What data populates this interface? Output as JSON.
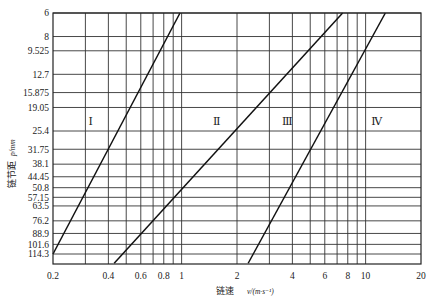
{
  "chart_data": {
    "type": "line",
    "title": "",
    "xlabel": "链速",
    "xlabel_unit": "v/(m·s⁻¹)",
    "ylabel": "链节距",
    "ylabel_unit": "p/mm",
    "x_scale": "log",
    "y_scale": "log",
    "y_inverted": true,
    "xlim": [
      0.2,
      20
    ],
    "ylim": [
      6,
      114.3
    ],
    "grid": true,
    "x_ticks": [
      0.2,
      0.4,
      0.6,
      0.8,
      1,
      2,
      4,
      6,
      8,
      10,
      20
    ],
    "x_tick_labels": [
      "0.2",
      "0.4",
      "0.6",
      "0.8",
      "1",
      "2",
      "4",
      "6",
      "8",
      "10",
      "20"
    ],
    "x_gridlines": [
      0.3,
      0.4,
      0.5,
      0.6,
      0.7,
      0.8,
      0.9,
      1,
      2,
      3,
      4,
      5,
      6,
      7,
      8,
      9,
      10
    ],
    "y_ticks": [
      6,
      8,
      9.525,
      12.7,
      15.875,
      19.05,
      25.4,
      31.75,
      38.1,
      44.45,
      50.8,
      57.15,
      63.5,
      76.2,
      88.9,
      101.6,
      114.3
    ],
    "y_tick_labels": [
      "6",
      "8",
      "9.525",
      "12.7",
      "15.875",
      "19.05",
      "25.4",
      "31.75",
      "38.1",
      "44.45",
      "50.8",
      "57.15",
      "63.5",
      "76.2",
      "88.9",
      "101.6",
      "114.3"
    ],
    "series": [
      {
        "name": "boundary I-II",
        "x": [
          0.2,
          0.98
        ],
        "y": [
          114.3,
          6
        ]
      },
      {
        "name": "boundary II-III",
        "x": [
          0.43,
          7.5
        ],
        "y": [
          128,
          6
        ]
      },
      {
        "name": "boundary III-IV",
        "x": [
          2.3,
          12.8
        ],
        "y": [
          128,
          6
        ]
      }
    ],
    "regions": [
      {
        "label": "Ⅰ",
        "x": 0.32,
        "y": 22.5
      },
      {
        "label": "Ⅱ",
        "x": 1.55,
        "y": 22.5
      },
      {
        "label": "Ⅲ",
        "x": 3.75,
        "y": 22.5
      },
      {
        "label": "Ⅳ",
        "x": 11.5,
        "y": 22.5
      }
    ]
  }
}
